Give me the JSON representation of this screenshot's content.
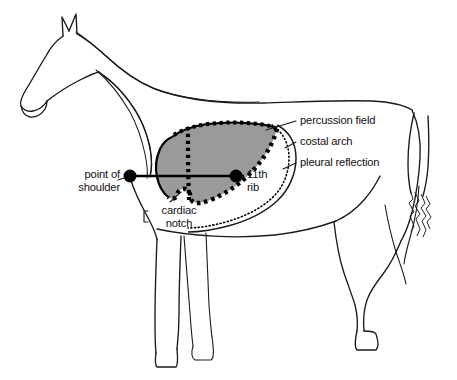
{
  "figure": {
    "topic": "thoracic percussion field",
    "background_color": "#ffffff",
    "outline_color": "#1a1a1a",
    "field_fill_color": "#9a9a9a",
    "field_border_color": "#000000",
    "text_color": "#111111"
  },
  "labels": {
    "percussion_field": "percussion field",
    "costal_arch": "costal arch",
    "pleural_reflection": "pleural reflection",
    "point_of_shoulder_line1": "point of",
    "point_of_shoulder_line2": "shoulder",
    "eleventh_rib_line1": "11th",
    "eleventh_rib_line2": "rib",
    "cardiac_notch_line1": "cardiac",
    "cardiac_notch_line2": "notch"
  },
  "markers": [
    {
      "name": "point-of-shoulder-dot",
      "x": 130,
      "y": 176,
      "r": 6.5,
      "color": "#000000"
    },
    {
      "name": "eleventh-rib-dot",
      "x": 236,
      "y": 176,
      "r": 6.5,
      "color": "#000000"
    }
  ],
  "annotations": {
    "shoulder_line_label": "line from point of shoulder to 11th rib",
    "field_boundary_style": "thick dotted",
    "pleural_reflection_style": "fine dotted curve",
    "costal_arch_style": "solid curve"
  }
}
